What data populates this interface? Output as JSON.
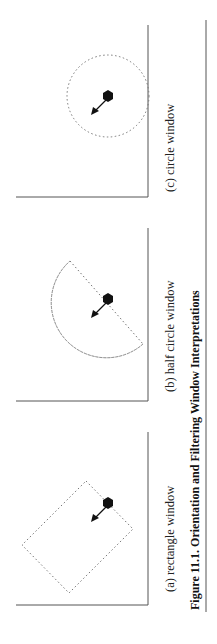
{
  "figure": {
    "caption": "Figure 11.1.  Orientation and Filtering Window Interpretations",
    "panels": [
      {
        "id": "a",
        "label": "(a) rectangle window",
        "shape": "rectangle"
      },
      {
        "id": "b",
        "label": "(b) half circle window",
        "shape": "half-circle"
      },
      {
        "id": "c",
        "label": "(c) circle window",
        "shape": "circle"
      }
    ]
  },
  "colors": {
    "line": "#555555",
    "dots": "#777777",
    "marker": "#111111"
  }
}
